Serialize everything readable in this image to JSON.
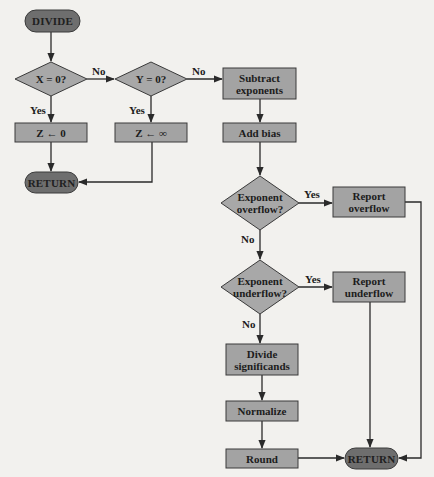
{
  "colors": {
    "background": "#f2f1ee",
    "process_fill": "#a3a3a3",
    "decision_fill": "#a8a8a8",
    "terminal_fill": "#6e6e6e",
    "stroke": "#3a3a3a",
    "line": "#2a2a2a"
  },
  "nodes": {
    "divide": {
      "label": "DIVIDE",
      "type": "terminal"
    },
    "x_zero": {
      "label": "X = 0?",
      "type": "decision"
    },
    "y_zero": {
      "label": "Y = 0?",
      "type": "decision"
    },
    "z_zero": {
      "label": "Z ← 0",
      "type": "process"
    },
    "z_inf": {
      "label": "Z ← ∞",
      "type": "process"
    },
    "return_left": {
      "label": "RETURN",
      "type": "terminal"
    },
    "subtract_exponents": {
      "label": "Subtract\nexponents",
      "type": "process"
    },
    "add_bias": {
      "label": "Add bias",
      "type": "process"
    },
    "exp_overflow": {
      "label": "Exponent\noverflow?",
      "type": "decision"
    },
    "report_overflow": {
      "label": "Report\noverflow",
      "type": "process"
    },
    "exp_underflow": {
      "label": "Exponent\nunderflow?",
      "type": "decision"
    },
    "report_underflow": {
      "label": "Report\nunderflow",
      "type": "process"
    },
    "divide_significands": {
      "label": "Divide\nsignificands",
      "type": "process"
    },
    "normalize": {
      "label": "Normalize",
      "type": "process"
    },
    "round": {
      "label": "Round",
      "type": "process"
    },
    "return_right": {
      "label": "RETURN",
      "type": "terminal"
    }
  },
  "edges": {
    "x_zero_no": "No",
    "x_zero_yes": "Yes",
    "y_zero_no": "No",
    "y_zero_yes": "Yes",
    "overflow_yes": "Yes",
    "overflow_no": "No",
    "underflow_yes": "Yes",
    "underflow_no": "No"
  }
}
